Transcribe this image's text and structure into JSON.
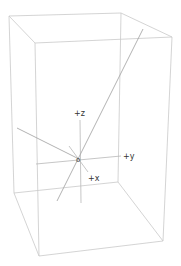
{
  "diagram": {
    "type": "3d-wireframe-box-with-axes",
    "colors": {
      "background": "#ffffff",
      "box_edge": "#c9c9c9",
      "axis": "#b8b8b8",
      "line": "#a9a9a9",
      "label": "#333333"
    },
    "labels": {
      "z_axis": "+z",
      "y_axis": "+y",
      "x_axis": "+x",
      "origin": "o"
    },
    "box": {
      "back_top_left": [
        9,
        16
      ],
      "back_top_right": [
        121,
        13
      ],
      "front_top_left": [
        35,
        43
      ],
      "front_top_right": [
        172,
        37
      ],
      "back_bottom_left": [
        14,
        193
      ],
      "back_bottom_right": [
        118,
        182
      ],
      "front_bottom_left": [
        39,
        256
      ],
      "front_bottom_right": [
        163,
        241
      ]
    },
    "origin_point": [
      79,
      159
    ]
  }
}
